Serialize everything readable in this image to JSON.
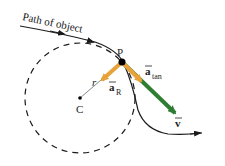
{
  "diagram": {
    "path_label": "Path of object",
    "point_label": "P",
    "center_label": "C",
    "radius_label": "r",
    "radial_accel": {
      "symbol": "a",
      "subscript": "R"
    },
    "tangential_accel": {
      "symbol": "a",
      "subscript": "tan"
    },
    "velocity": {
      "symbol": "v"
    },
    "colors": {
      "path": "#1a1a1a",
      "circle": "#1a1a1a",
      "acceleration": "#e8a23a",
      "velocity": "#2e7d32",
      "radius_line": "#888888"
    }
  }
}
